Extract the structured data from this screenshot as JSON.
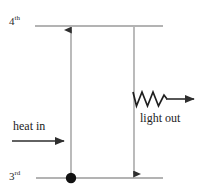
{
  "figure": {
    "type": "energy-level-diagram",
    "background_color": "#ffffff",
    "stroke_color": "#3a3a3a",
    "text_color": "#232323",
    "width": 213,
    "height": 194
  },
  "levels": {
    "upper": {
      "name": "4th",
      "number": "4",
      "ordinal_suffix": "th",
      "y": 26,
      "x_start": 35,
      "x_end": 163
    },
    "lower": {
      "name": "3rd",
      "number": "3",
      "ordinal_suffix": "rd",
      "y": 178,
      "x_start": 36,
      "x_end": 163
    }
  },
  "population_dot": {
    "name": "population-dot",
    "x": 71,
    "y": 178,
    "radius": 5,
    "color": "#111111"
  },
  "transitions": [
    {
      "id": "absorption",
      "label": "heat in",
      "direction": "up",
      "x": 71,
      "from_y": 176,
      "to_y": 28
    },
    {
      "id": "emission",
      "label": "light out",
      "direction": "down",
      "x": 134,
      "from_y": 27,
      "to_y": 176
    }
  ],
  "annotations": {
    "heat_in": {
      "label": "heat in",
      "arrow": {
        "direction": "right",
        "x_start": 12,
        "x_end": 70,
        "y": 141
      }
    },
    "light_out": {
      "label": "light out",
      "photon": {
        "shape": "zigzag",
        "peaks": 3,
        "x_start": 134,
        "x_end": 166,
        "y": 99,
        "amplitude": 7
      },
      "arrow": {
        "direction": "right",
        "x_start": 166,
        "x_end": 201,
        "y": 99
      }
    }
  }
}
